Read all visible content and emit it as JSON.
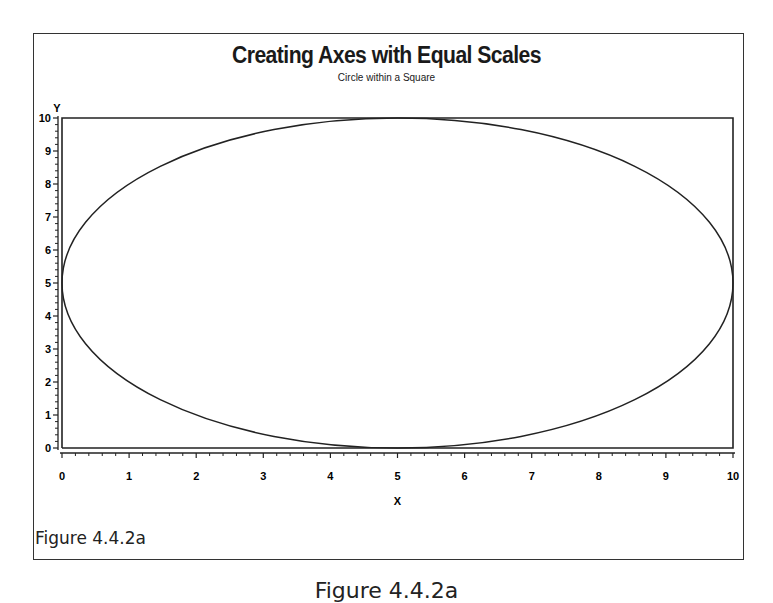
{
  "figure": {
    "title": "Creating Axes with Equal Scales",
    "subtitle": "Circle within a Square",
    "inner_label": "Figure 4.4.2a",
    "caption": "Figure 4.4.2a"
  },
  "chart_data": {
    "type": "line",
    "title": "Creating Axes with Equal Scales",
    "subtitle": "Circle within a Square",
    "xlabel": "X",
    "ylabel": "Y",
    "xlim": [
      0,
      10
    ],
    "ylim": [
      0,
      10
    ],
    "x_ticks": [
      "0",
      "1",
      "2",
      "3",
      "4",
      "5",
      "6",
      "7",
      "8",
      "9",
      "10"
    ],
    "y_ticks": [
      "0",
      "1",
      "2",
      "3",
      "4",
      "5",
      "6",
      "7",
      "8",
      "9",
      "10"
    ],
    "x_minor_ticks_per_major": 4,
    "y_minor_ticks_per_major": 4,
    "grid": false,
    "legend": null,
    "series": [
      {
        "name": "square",
        "shape": "rectangle",
        "x": [
          0,
          10,
          10,
          0,
          0
        ],
        "y": [
          0,
          0,
          10,
          10,
          0
        ]
      },
      {
        "name": "circle",
        "shape": "ellipse",
        "center": [
          5,
          5
        ],
        "radius": 5
      }
    ],
    "annotations": [
      "Figure 4.4.2a"
    ]
  }
}
